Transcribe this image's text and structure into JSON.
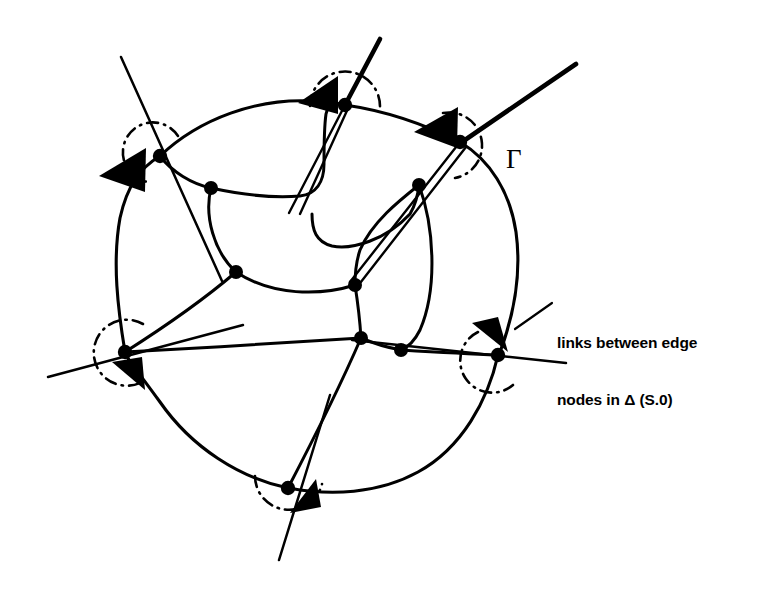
{
  "figure": {
    "background_color": "#ffffff",
    "ink_color": "#000000"
  },
  "labels": {
    "gamma": "Γ",
    "annotation_line1": "links between edge",
    "annotation_line2": "nodes in Δ (S.0)",
    "annotation_full": "links between edge nodes in Δ (S.0)"
  },
  "diagram_data": {
    "type": "graph",
    "description": "Closed curve Gamma enclosing a mesh of interior nodes; six edge nodes on the boundary each carry a dash-dot arc and a solid arrowhead, with rays crossing the boundary outward.",
    "edge_nodes": [
      {
        "id": "n-top-left",
        "x": 160,
        "y": 156,
        "arc_side": "upper-left",
        "arrow": true
      },
      {
        "id": "n-top-center",
        "x": 345,
        "y": 105,
        "arc_side": "top",
        "arrow": true
      },
      {
        "id": "n-top-right",
        "x": 460,
        "y": 142,
        "arc_side": "right",
        "arrow": true
      },
      {
        "id": "n-left",
        "x": 125,
        "y": 352,
        "arc_side": "left",
        "arrow": true
      },
      {
        "id": "n-right",
        "x": 498,
        "y": 355,
        "arc_side": "lower-right",
        "arrow": true
      },
      {
        "id": "n-bottom",
        "x": 288,
        "y": 488,
        "arc_side": "bottom",
        "arrow": true
      }
    ],
    "interior_nodes": [
      {
        "id": "i1",
        "x": 211,
        "y": 188
      },
      {
        "id": "i2",
        "x": 236,
        "y": 272
      },
      {
        "id": "i3",
        "x": 355,
        "y": 285
      },
      {
        "id": "i4",
        "x": 419,
        "y": 185
      },
      {
        "id": "i5",
        "x": 361,
        "y": 338
      },
      {
        "id": "i6",
        "x": 401,
        "y": 350
      }
    ],
    "edge_node_count": 6,
    "interior_node_count": 6,
    "total_node_count": 12,
    "ray_count": 6,
    "arc_style": "dash-dot",
    "boundary_label": "Γ"
  }
}
